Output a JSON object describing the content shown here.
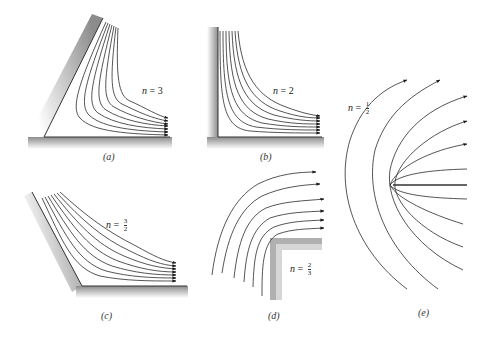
{
  "panels": [
    {
      "id": "a",
      "caption": "(a)",
      "n_label": "n = 3",
      "n_var": "n",
      "n_eq": " = ",
      "n_value": "3"
    },
    {
      "id": "b",
      "caption": "(b)",
      "n_label": "n = 2",
      "n_var": "n",
      "n_eq": " = ",
      "n_value": "2"
    },
    {
      "id": "c",
      "caption": "(c)",
      "n_label": "n = 3/2",
      "n_var": "n",
      "n_eq": " = ",
      "n_num": "3",
      "n_den": "2"
    },
    {
      "id": "d",
      "caption": "(d)",
      "n_label": "n = 2/3",
      "n_var": "n",
      "n_eq": " = ",
      "n_num": "2",
      "n_den": "3"
    },
    {
      "id": "e",
      "caption": "(e)",
      "n_label": "n = 1/2",
      "n_var": "n",
      "n_eq": " = ",
      "n_num": "1",
      "n_den": "2"
    }
  ],
  "colors": {
    "stroke": "#2a2a2a",
    "wall_shade": "#9a9a9a",
    "background": "#ffffff"
  }
}
